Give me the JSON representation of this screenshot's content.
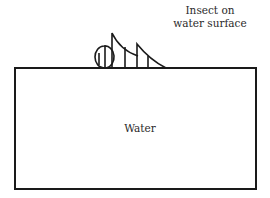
{
  "diagram": {
    "labels": {
      "insect": "Insect on\nwater surface",
      "insect_line1": "Insect on",
      "insect_line2": "water surface",
      "water": "Water"
    },
    "colors": {
      "stroke": "#1a1a1a",
      "background": "#ffffff"
    }
  }
}
